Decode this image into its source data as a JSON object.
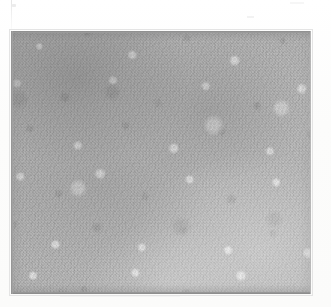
{
  "page": {
    "background_color": "#fdfdfc",
    "width": 331,
    "height": 307,
    "caption": ""
  },
  "figure": {
    "name": "micrograph-plate",
    "kind": "scanned-grayscale-photomicrograph",
    "frame": {
      "left": 11,
      "top": 31,
      "width": 300,
      "height": 263
    },
    "border_color": "#8b8b8b",
    "base_tone": "#a9a9a9",
    "highlight_tone": "#e8e8e8",
    "shadow_tone": "#8a8a8a",
    "tonal_note": "denser and darker toward the upper-left, lighter toward the lower-right",
    "label": ""
  },
  "margins": {
    "top_height": 31,
    "bottom_height": 13,
    "left_width": 11,
    "right_width": 20,
    "color": "#fcfcfb",
    "artifacts": [
      {
        "name": "scan-line-vertical",
        "note": "faint vertical scanner streak at the left margin"
      },
      {
        "name": "scan-speck-top-left",
        "note": "small gray speck near the top-left corner"
      },
      {
        "name": "scan-speck-top-right",
        "note": "faint horizontal streak in the upper-right margin"
      },
      {
        "name": "scan-speck-bottom",
        "note": "faint horizontal streak below the plate"
      }
    ]
  }
}
